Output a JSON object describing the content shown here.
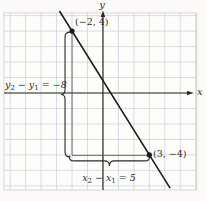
{
  "figure_title": "",
  "colors": {
    "background": "#fbfaf8",
    "plot_background": "#fdfdfc",
    "grid": "#c8cdd2",
    "axis": "#2a2a2a",
    "line": "#1c1c1c",
    "leg": "#4a4a4a",
    "brace": "#2a2a2a",
    "text": "#2d2d2d"
  },
  "chart_data": {
    "type": "line",
    "title": "",
    "grid": true,
    "xlim": [
      -6.4,
      6.05
    ],
    "ylim": [
      -6.27,
      5.17
    ],
    "axis": {
      "x_label": "x",
      "y_label": "y"
    },
    "points": [
      {
        "x": -2,
        "y": 4,
        "label": "(−2, 4)"
      },
      {
        "x": 3,
        "y": -4,
        "label": "(3, −4)"
      }
    ],
    "line": {
      "through_points": true,
      "slope": -1.6,
      "y_intercept": 0.8,
      "extends_beyond_grid": true
    },
    "slope_triangle": {
      "shown": true,
      "vertical_leg_x": -2,
      "horizontal_leg_y": -4
    },
    "annotations": [
      {
        "id": "delta-y",
        "text": "y2 − y1 = −8",
        "value": -8,
        "orientation": "vertical",
        "parts": [
          {
            "v": "y"
          },
          {
            "v": "2",
            "sub": true
          },
          {
            "v": " − "
          },
          {
            "v": "y"
          },
          {
            "v": "1",
            "sub": true
          },
          {
            "v": " = −8"
          }
        ]
      },
      {
        "id": "delta-x",
        "text": "x2 − x1 = 5",
        "value": 5,
        "orientation": "horizontal",
        "parts": [
          {
            "v": "x"
          },
          {
            "v": "2",
            "sub": true
          },
          {
            "v": " − "
          },
          {
            "v": "x"
          },
          {
            "v": "1",
            "sub": true
          },
          {
            "v": " = 5"
          }
        ]
      }
    ]
  }
}
